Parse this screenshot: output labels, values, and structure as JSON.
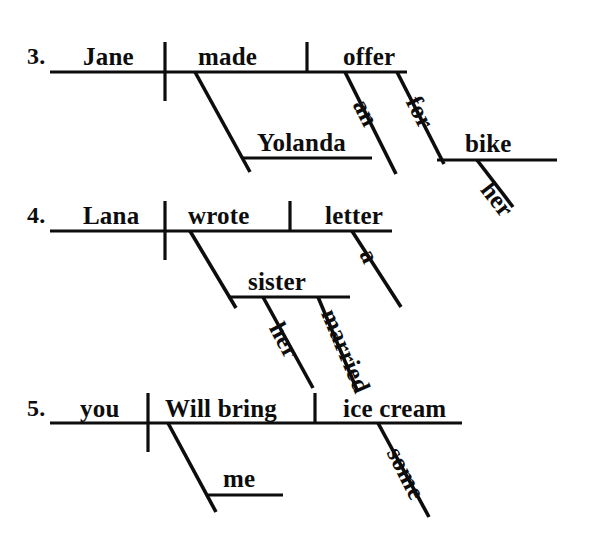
{
  "page": {
    "background_color": "#ffffff",
    "ink_color": "#0d0d0d",
    "width": 590,
    "height": 534
  },
  "exercises": [
    {
      "number": "3.",
      "sentence_words": [
        "Jane",
        "made",
        "offer",
        "Yolanda",
        "an",
        "for",
        "bike",
        "her"
      ],
      "subject": "Jane",
      "verb": "made",
      "direct_object": "offer",
      "indirect_object": "Yolanda",
      "modifiers": [
        "an",
        "for",
        "bike",
        "her"
      ],
      "labels": {
        "number": "3.",
        "subject": "Jane",
        "verb": "made",
        "object": "offer",
        "indirect_object": "Yolanda",
        "article": "an",
        "preposition": "for",
        "prep_object": "bike",
        "possessive": "her"
      }
    },
    {
      "number": "4.",
      "sentence_words": [
        "Lana",
        "wrote",
        "letter",
        "sister",
        "a",
        "her",
        "married"
      ],
      "subject": "Lana",
      "verb": "wrote",
      "direct_object": "letter",
      "indirect_object": "sister",
      "modifiers": [
        "a",
        "her",
        "married"
      ],
      "labels": {
        "number": "4.",
        "subject": "Lana",
        "verb": "wrote",
        "object": "letter",
        "indirect_object": "sister",
        "article": "a",
        "possessive": "her",
        "adjective": "married"
      }
    },
    {
      "number": "5.",
      "sentence_words": [
        "you",
        "Will bring",
        "ice cream",
        "me",
        "some"
      ],
      "subject": "you",
      "verb": "Will bring",
      "direct_object": "ice cream",
      "indirect_object": "me",
      "modifiers": [
        "some"
      ],
      "labels": {
        "number": "5.",
        "subject": "you",
        "verb": "Will bring",
        "object": "ice cream",
        "indirect_object": "me",
        "quantifier": "some"
      }
    }
  ]
}
